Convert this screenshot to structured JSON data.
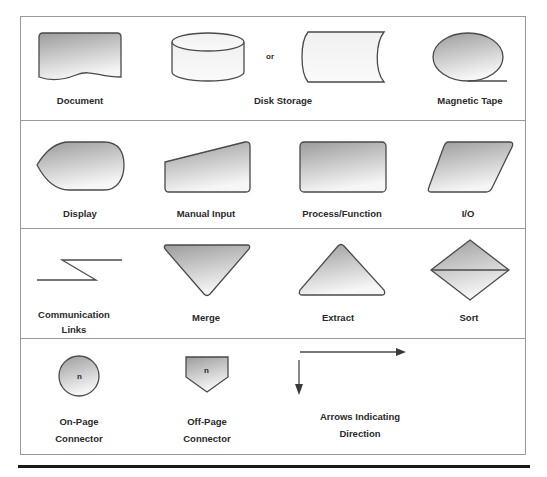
{
  "rows": [
    {
      "symbols": [
        {
          "id": "document",
          "label": "Document"
        },
        {
          "id": "disk-storage",
          "label": "Disk Storage",
          "separator": "or"
        },
        {
          "id": "magnetic-tape",
          "label": "Magnetic Tape"
        }
      ]
    },
    {
      "symbols": [
        {
          "id": "display",
          "label": "Display"
        },
        {
          "id": "manual-input",
          "label": "Manual Input"
        },
        {
          "id": "process-function",
          "label": "Process/Function"
        },
        {
          "id": "io",
          "label": "I/O"
        }
      ]
    },
    {
      "symbols": [
        {
          "id": "communication-links",
          "label_line1": "Communication",
          "label_line2": "Links"
        },
        {
          "id": "merge",
          "label": "Merge"
        },
        {
          "id": "extract",
          "label": "Extract"
        },
        {
          "id": "sort",
          "label": "Sort"
        }
      ]
    },
    {
      "symbols": [
        {
          "id": "on-page-connector",
          "label_line1": "On-Page",
          "label_line2": "Connector",
          "glyph": "n"
        },
        {
          "id": "off-page-connector",
          "label_line1": "Off-Page",
          "label_line2": "Connector",
          "glyph": "n"
        },
        {
          "id": "arrows",
          "label_line1": "Arrows Indicating",
          "label_line2": "Direction"
        }
      ]
    }
  ],
  "colors": {
    "stroke": "#4a4a4a",
    "fill_dark": "#9e9e9e",
    "fill_light": "#f4f4f4",
    "border": "#9a9a9a",
    "text": "#2a2a2a"
  }
}
